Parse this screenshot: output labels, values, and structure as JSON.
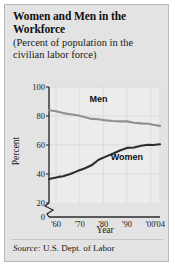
{
  "figure": {
    "title": "Women and Men in the Workforce",
    "subtitle": "(Percent of population in the civilian labor force)",
    "source_word": "Source:",
    "source_text": " U.S. Dept. of Labor",
    "background_color": "#e3e3e3",
    "border_color": "#b9b9b9"
  },
  "chart_data": {
    "type": "line",
    "title": "Women and Men in the Workforce",
    "subtitle": "(Percent of population in the civilian labor force)",
    "xlabel": "Year",
    "ylabel": "Percent",
    "xlim": [
      1957,
      2004
    ],
    "ylim": [
      20,
      100
    ],
    "y_axis_break": true,
    "y_axis_break_note": "axis broken between 0 and 20",
    "yticks": [
      0,
      20,
      40,
      60,
      80,
      100
    ],
    "ytick_labels": [
      "0",
      "20",
      "40",
      "60",
      "80",
      "100"
    ],
    "xticks": [
      1960,
      1970,
      1980,
      1990,
      2000,
      2004
    ],
    "xtick_labels": [
      "'60",
      "'70",
      "'80",
      "'90",
      "'00",
      "'04"
    ],
    "grid": true,
    "legend": "inline-labels",
    "series": [
      {
        "name": "Men",
        "color": "#8f8f8f",
        "label_position": {
          "x": 1978,
          "y": 90
        },
        "x": [
          1957,
          1960,
          1963,
          1966,
          1969,
          1972,
          1975,
          1978,
          1981,
          1984,
          1987,
          1990,
          1993,
          1996,
          1999,
          2001,
          2004
        ],
        "values": [
          84.0,
          83.3,
          82.0,
          81.2,
          80.5,
          79.3,
          78.0,
          77.8,
          77.0,
          76.5,
          76.3,
          76.3,
          75.3,
          74.9,
          74.7,
          74.0,
          73.2
        ]
      },
      {
        "name": "Women",
        "color": "#2d2d2d",
        "label_position": {
          "x": 1990,
          "y": 50
        },
        "x": [
          1957,
          1959,
          1961,
          1963,
          1966,
          1969,
          1972,
          1975,
          1978,
          1981,
          1984,
          1987,
          1990,
          1993,
          1996,
          1999,
          2001,
          2004
        ],
        "values": [
          36.5,
          37.2,
          38.0,
          38.5,
          40.0,
          42.0,
          43.8,
          46.0,
          49.8,
          52.0,
          54.0,
          56.2,
          58.0,
          58.3,
          59.5,
          60.2,
          60.0,
          60.5
        ]
      }
    ]
  }
}
